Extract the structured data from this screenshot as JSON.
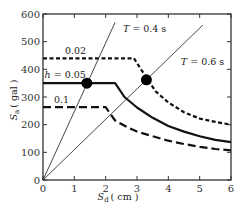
{
  "chart_data": {
    "type": "line",
    "title": "",
    "xlabel": "S_d (cm)",
    "ylabel": "S_a (gal)",
    "xlim": [
      0,
      6
    ],
    "ylim": [
      0,
      600
    ],
    "xticks": [
      "0",
      "1",
      "2",
      "3",
      "4",
      "5",
      "6"
    ],
    "yticks": [
      "0",
      "100",
      "200",
      "300",
      "400",
      "500",
      "600"
    ],
    "grid": false,
    "series": [
      {
        "name": "0.02",
        "style": "short-dash",
        "points": [
          [
            0,
            440
          ],
          [
            2.9,
            440
          ],
          [
            3.3,
            370
          ],
          [
            3.6,
            320
          ],
          [
            4,
            280
          ],
          [
            4.5,
            245
          ],
          [
            5,
            222
          ],
          [
            5.5,
            210
          ],
          [
            6,
            200
          ]
        ]
      },
      {
        "name": "h = 0.05",
        "style": "solid",
        "points": [
          [
            0,
            350
          ],
          [
            2.3,
            350
          ],
          [
            2.6,
            300
          ],
          [
            3,
            262
          ],
          [
            3.5,
            225
          ],
          [
            4,
            195
          ],
          [
            4.5,
            175
          ],
          [
            5,
            158
          ],
          [
            5.5,
            145
          ],
          [
            6,
            137
          ]
        ]
      },
      {
        "name": "0.1",
        "style": "long-dash",
        "points": [
          [
            0,
            263
          ],
          [
            2.0,
            263
          ],
          [
            2.3,
            215
          ],
          [
            2.7,
            190
          ],
          [
            3,
            175
          ],
          [
            3.5,
            158
          ],
          [
            4,
            142
          ],
          [
            4.5,
            130
          ],
          [
            5,
            120
          ],
          [
            5.5,
            112
          ],
          [
            6,
            107
          ]
        ]
      },
      {
        "name": "T = 0.4 s",
        "style": "thin-solid",
        "points": [
          [
            0,
            0
          ],
          [
            2.3,
            570
          ]
        ]
      },
      {
        "name": "T = 0.6 s",
        "style": "thin-solid",
        "points": [
          [
            0,
            0
          ],
          [
            5.1,
            560
          ]
        ]
      }
    ],
    "markers": [
      {
        "x": 1.4,
        "y": 350
      },
      {
        "x": 3.3,
        "y": 362
      }
    ],
    "annotations": [
      {
        "text": "T = 0.4 s",
        "x": 2.55,
        "y": 535
      },
      {
        "text": "T = 0.6 s",
        "x": 4.4,
        "y": 415
      },
      {
        "text": "0.02",
        "x": 0.7,
        "y": 455
      },
      {
        "text": "h = 0.05",
        "x": 0.05,
        "y": 367
      },
      {
        "text": "0.1",
        "x": 0.35,
        "y": 280
      }
    ]
  },
  "labels": {
    "xlabel_main": "S",
    "xlabel_sub": "d",
    "xlabel_unit": "( cm )",
    "ylabel_main": "S",
    "ylabel_sub": "a",
    "ylabel_unit": "( gal )"
  }
}
